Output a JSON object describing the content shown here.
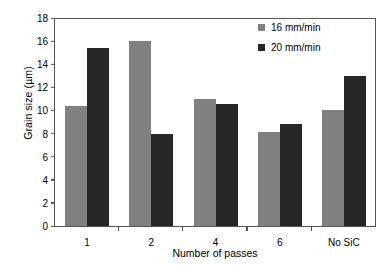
{
  "chart_data": {
    "type": "bar",
    "title": "",
    "xlabel": "Number of passes",
    "ylabel": "Grain size (µm)",
    "categories": [
      "1",
      "2",
      "4",
      "6",
      "No SiC"
    ],
    "series": [
      {
        "name": "16 mm/min",
        "color": "#808080",
        "values": [
          10.4,
          16.0,
          11.0,
          8.1,
          10.0
        ]
      },
      {
        "name": "20 mm/min",
        "color": "#262626",
        "values": [
          15.4,
          8.0,
          10.6,
          8.8,
          13.0
        ]
      }
    ],
    "ylim": [
      0,
      18
    ],
    "yticks": [
      18,
      16,
      14,
      12,
      10,
      8,
      6,
      4,
      2,
      0
    ],
    "grid": false,
    "legend_position": "top-right"
  }
}
